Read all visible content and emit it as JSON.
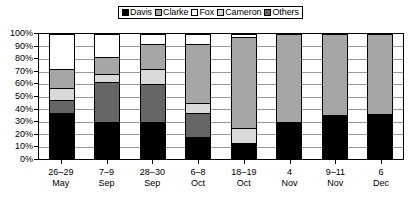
{
  "chart_data": {
    "type": "bar",
    "subtype": "stacked-percentage",
    "title": "",
    "xlabel": "",
    "ylabel": "",
    "ylim": [
      0,
      100
    ],
    "grid": true,
    "legend_position": "top-center",
    "categories": [
      "26–29 May",
      "7–9 Sep",
      "28–30 Sep",
      "6–8 Oct",
      "18–19 Oct",
      "4 Nov",
      "9–11 Nov",
      "6 Dec"
    ],
    "category_lines": [
      {
        "line1": "26–29",
        "line2": "May"
      },
      {
        "line1": "7–9",
        "line2": "Sep"
      },
      {
        "line1": "28–30",
        "line2": "Sep"
      },
      {
        "line1": "6–8",
        "line2": "Oct"
      },
      {
        "line1": "18–19",
        "line2": "Oct"
      },
      {
        "line1": "4",
        "line2": "Nov"
      },
      {
        "line1": "9–11",
        "line2": "Nov"
      },
      {
        "line1": "6",
        "line2": "Dec"
      }
    ],
    "ytick_labels": [
      "100%",
      "90%",
      "80%",
      "70%",
      "60%",
      "50%",
      "40%",
      "30%",
      "20%",
      "10%",
      "0%"
    ],
    "ytick_values": [
      100,
      90,
      80,
      70,
      60,
      50,
      40,
      30,
      20,
      10,
      0
    ],
    "series": [
      {
        "name": "Davis",
        "color": "#000000",
        "values": [
          37,
          30,
          30,
          18,
          13,
          30,
          35,
          36
        ]
      },
      {
        "name": "Clarke",
        "color": "#a6a6a6",
        "values": [
          15,
          14,
          20,
          47,
          73,
          70,
          65,
          64
        ]
      },
      {
        "name": "Fox",
        "color": "#ffffff",
        "values": [
          28,
          18,
          8,
          8,
          2,
          0,
          0,
          0
        ]
      },
      {
        "name": "Cameron",
        "color": "#d9d9d9",
        "values": [
          10,
          6,
          12,
          8,
          12,
          0,
          0,
          0
        ]
      },
      {
        "name": "Others",
        "color": "#666666",
        "values": [
          10,
          32,
          30,
          19,
          0,
          0,
          0,
          0
        ]
      }
    ],
    "stack_order_bottom_to_top": [
      "Davis",
      "Others",
      "Cameron",
      "Clarke",
      "Fox"
    ],
    "bars": [
      {
        "category": "26–29 May",
        "segments": [
          {
            "name": "Davis",
            "value": 37,
            "color": "#000000"
          },
          {
            "name": "Others",
            "value": 10,
            "color": "#666666"
          },
          {
            "name": "Cameron",
            "value": 10,
            "color": "#d9d9d9"
          },
          {
            "name": "Clarke",
            "value": 15,
            "color": "#a6a6a6"
          },
          {
            "name": "Fox",
            "value": 28,
            "color": "#ffffff"
          }
        ]
      },
      {
        "category": "7–9 Sep",
        "segments": [
          {
            "name": "Davis",
            "value": 30,
            "color": "#000000"
          },
          {
            "name": "Others",
            "value": 32,
            "color": "#666666"
          },
          {
            "name": "Cameron",
            "value": 6,
            "color": "#d9d9d9"
          },
          {
            "name": "Clarke",
            "value": 14,
            "color": "#a6a6a6"
          },
          {
            "name": "Fox",
            "value": 18,
            "color": "#ffffff"
          }
        ]
      },
      {
        "category": "28–30 Sep",
        "segments": [
          {
            "name": "Davis",
            "value": 30,
            "color": "#000000"
          },
          {
            "name": "Others",
            "value": 30,
            "color": "#666666"
          },
          {
            "name": "Cameron",
            "value": 12,
            "color": "#d9d9d9"
          },
          {
            "name": "Clarke",
            "value": 20,
            "color": "#a6a6a6"
          },
          {
            "name": "Fox",
            "value": 8,
            "color": "#ffffff"
          }
        ]
      },
      {
        "category": "6–8 Oct",
        "segments": [
          {
            "name": "Davis",
            "value": 18,
            "color": "#000000"
          },
          {
            "name": "Others",
            "value": 19,
            "color": "#666666"
          },
          {
            "name": "Cameron",
            "value": 8,
            "color": "#d9d9d9"
          },
          {
            "name": "Clarke",
            "value": 47,
            "color": "#a6a6a6"
          },
          {
            "name": "Fox",
            "value": 8,
            "color": "#ffffff"
          }
        ]
      },
      {
        "category": "18–19 Oct",
        "segments": [
          {
            "name": "Davis",
            "value": 13,
            "color": "#000000"
          },
          {
            "name": "Cameron",
            "value": 12,
            "color": "#d9d9d9"
          },
          {
            "name": "Clarke",
            "value": 73,
            "color": "#a6a6a6"
          },
          {
            "name": "Fox",
            "value": 2,
            "color": "#ffffff"
          }
        ]
      },
      {
        "category": "4 Nov",
        "segments": [
          {
            "name": "Davis",
            "value": 30,
            "color": "#000000"
          },
          {
            "name": "Clarke",
            "value": 70,
            "color": "#a6a6a6"
          }
        ]
      },
      {
        "category": "9–11 Nov",
        "segments": [
          {
            "name": "Davis",
            "value": 35,
            "color": "#000000"
          },
          {
            "name": "Clarke",
            "value": 65,
            "color": "#a6a6a6"
          }
        ]
      },
      {
        "category": "6 Dec",
        "segments": [
          {
            "name": "Davis",
            "value": 36,
            "color": "#000000"
          },
          {
            "name": "Clarke",
            "value": 64,
            "color": "#a6a6a6"
          }
        ]
      }
    ]
  },
  "legend": {
    "items": [
      {
        "label": "Davis",
        "color": "#000000"
      },
      {
        "label": "Clarke",
        "color": "#a6a6a6"
      },
      {
        "label": "Fox",
        "color": "#ffffff"
      },
      {
        "label": "Cameron",
        "color": "#d9d9d9"
      },
      {
        "label": "Others",
        "color": "#666666"
      }
    ]
  }
}
